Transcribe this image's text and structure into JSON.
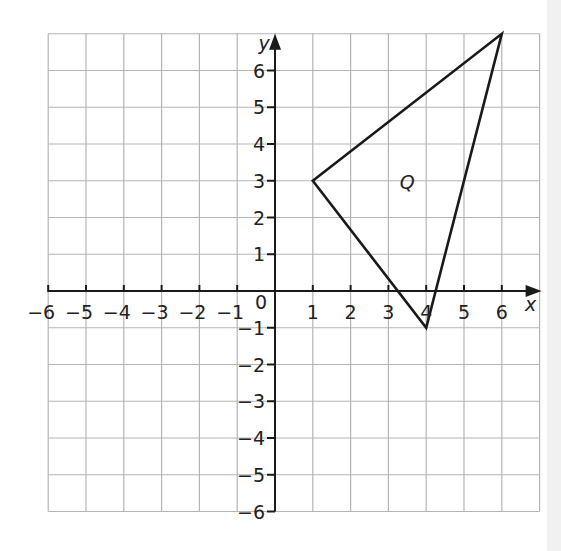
{
  "diagram": {
    "type": "coordinate-grid",
    "axes": {
      "x_label": "x",
      "y_label": "y",
      "x_range": [
        -6,
        7
      ],
      "y_range": [
        -6,
        7
      ],
      "x_ticks": [
        "-6",
        "-5",
        "-4",
        "-3",
        "-2",
        "-1",
        "1",
        "2",
        "3",
        "4",
        "5",
        "6"
      ],
      "y_ticks": [
        "-6",
        "-5",
        "-4",
        "-3",
        "-2",
        "-1",
        "1",
        "2",
        "3",
        "4",
        "5",
        "6"
      ],
      "origin_label": "0"
    },
    "shape": {
      "name": "Q",
      "type": "triangle",
      "vertices": [
        [
          1,
          3
        ],
        [
          6,
          7
        ],
        [
          4,
          -1
        ]
      ]
    },
    "colors": {
      "grid": "#b5b5b5",
      "axis": "#1a1a1a",
      "shape": "#1a1a1a",
      "text": "#222222"
    }
  }
}
